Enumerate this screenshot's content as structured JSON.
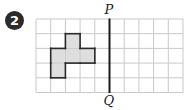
{
  "question_number": "2",
  "grid": {
    "columns": 10,
    "rows": 5,
    "origin_x": 36,
    "origin_y": 19,
    "cell_size": 14.7,
    "line_color": "#c9c9c9"
  },
  "mirror_line": {
    "top_label": "P",
    "bottom_label": "Q",
    "column_index": 5,
    "color": "#1a1a1a"
  },
  "shape": {
    "fill": "#dedede",
    "stroke": "#2a2a2a",
    "cells": [
      [
        2,
        1
      ],
      [
        1,
        2
      ],
      [
        2,
        2
      ],
      [
        3,
        2
      ],
      [
        1,
        3
      ]
    ]
  }
}
